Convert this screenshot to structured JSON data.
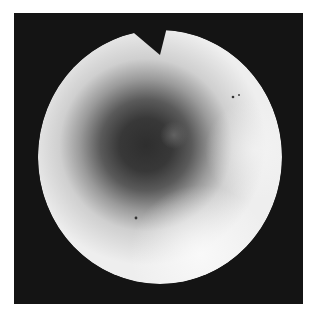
{
  "image": {
    "description": "Grayscale circular endoscopic view with dark central lumen and notch at top",
    "colors": {
      "background": "#ffffff",
      "frame": "#141414",
      "bright": "#f2f2f2",
      "mid": "#b5b5b5",
      "dark": "#2a2a2a"
    }
  }
}
